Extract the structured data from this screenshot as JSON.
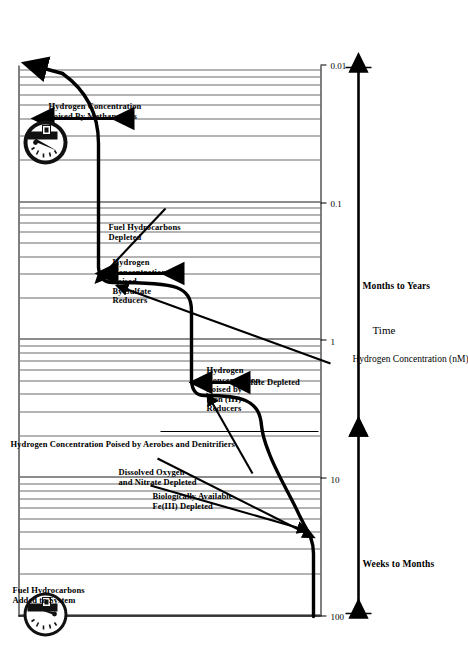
{
  "figure": {
    "title": "",
    "x_axis_label": "Time",
    "y_axis_label": "Hydrogen Concentration (nM)"
  },
  "axes": {
    "y_ticks": [
      "100",
      "10",
      "1",
      "0.1",
      "0.01"
    ],
    "x_phases": [
      {
        "label": "Weeks to Months"
      },
      {
        "label": "Months to Years"
      }
    ]
  },
  "annotations": {
    "fuel_added": "Fuel Hydrocarbons\nAdded to System",
    "oxygen_nitrate": "Dissolved Oxygen\nand Nitrate Depleted",
    "iron_depleted": "Biologically Available\nFe(III) Depleted",
    "sulfate_depleted": "Sulfate Depleted",
    "fuel_depleted": "Fuel Hydrocarbons\nDepleted",
    "poised_aerobes": "Hydrogen Concentration Poised by Aerobes and Denitrifiers",
    "poised_iron": "Hydrogen\nConcentration\nPoised by\nIron (III)\nReducers",
    "poised_sulfate": "Hydrogen\nConcentration\nPoised\nBy Sulfate\nReducers",
    "poised_methanogens": "Hydrogen Concentration\nPoised By Methanogens"
  },
  "icons": {
    "gauge_full_label": "FUEL GAUGE",
    "gauge_empty_label": "FUEL GAUGE",
    "gauge_full_name": "fuel-gauge-full-icon",
    "gauge_empty_name": "fuel-gauge-empty-icon"
  },
  "colors": {
    "ink": "#000000",
    "grid": "#6a6a6a",
    "background": "#ffffff"
  },
  "chart_data": {
    "type": "line",
    "title": "",
    "xlabel": "Time",
    "ylabel": "Hydrogen Concentration (nM)",
    "yscale": "log",
    "ylim": [
      0.01,
      100
    ],
    "ytick_values": [
      100,
      10,
      1,
      0.1,
      0.01
    ],
    "grid": true,
    "legend": "none",
    "x_phase_labels": [
      "Weeks to Months",
      "Months to Years"
    ],
    "series": [
      {
        "name": "Dissolved hydrogen concentration",
        "x": [
          0.0,
          0.02,
          0.05,
          0.1,
          0.16,
          0.22,
          0.26,
          0.3,
          0.34,
          0.4,
          0.46,
          0.5,
          0.54,
          0.58,
          0.63,
          0.7,
          0.78,
          0.86,
          0.93,
          1.0
        ],
        "y": [
          0.02,
          0.02,
          0.03,
          0.05,
          0.2,
          0.28,
          0.3,
          0.31,
          0.33,
          1.4,
          1.6,
          1.65,
          1.7,
          1.75,
          9.0,
          9.5,
          9.6,
          9.6,
          20.0,
          100.0
        ],
        "description": "Stepwise increase of dissolved H2 as successive terminal electron acceptors are depleted"
      }
    ],
    "phase_ranges": [
      {
        "name": "Hydrogen Concentration Poised by Aerobes and Denitrifiers",
        "y_approx": 0.02
      },
      {
        "name": "Hydrogen Concentration Poised by Iron (III) Reducers",
        "y_range": [
          0.2,
          0.4
        ]
      },
      {
        "name": "Hydrogen Concentration Poised By Sulfate Reducers",
        "y_range": [
          1.0,
          3.0
        ]
      },
      {
        "name": "Hydrogen Concentration Poised By Methanogens",
        "y_range": [
          7.0,
          12.0
        ]
      }
    ],
    "events": [
      {
        "label": "Fuel Hydrocarbons Added to System",
        "x": 0.0
      },
      {
        "label": "Dissolved Oxygen and Nitrate Depleted",
        "x": 0.14
      },
      {
        "label": "Biologically Available Fe(III) Depleted",
        "x": 0.38
      },
      {
        "label": "Sulfate Depleted",
        "x": 0.61
      },
      {
        "label": "Fuel Hydrocarbons Depleted",
        "x": 0.9
      }
    ]
  }
}
